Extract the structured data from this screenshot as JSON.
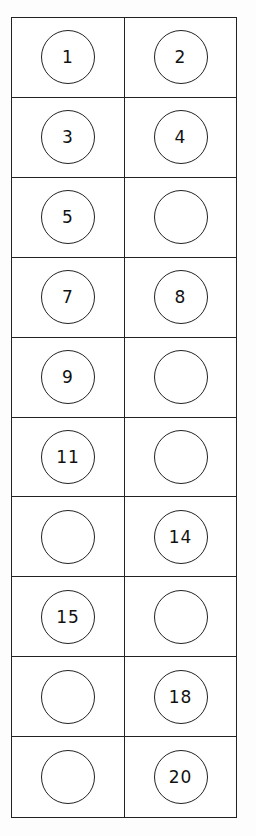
{
  "worksheet": {
    "title": "Number chart 1-20 (fill in missing numbers)",
    "columns": 2,
    "rows": 10,
    "cells": [
      {
        "number": "1",
        "blank": false
      },
      {
        "number": "2",
        "blank": false
      },
      {
        "number": "3",
        "blank": false
      },
      {
        "number": "4",
        "blank": false
      },
      {
        "number": "5",
        "blank": false
      },
      {
        "number": "",
        "blank": true
      },
      {
        "number": "7",
        "blank": false
      },
      {
        "number": "8",
        "blank": false
      },
      {
        "number": "9",
        "blank": false
      },
      {
        "number": "",
        "blank": true
      },
      {
        "number": "11",
        "blank": false
      },
      {
        "number": "",
        "blank": true
      },
      {
        "number": "",
        "blank": true
      },
      {
        "number": "14",
        "blank": false
      },
      {
        "number": "15",
        "blank": false
      },
      {
        "number": "",
        "blank": true
      },
      {
        "number": "",
        "blank": true
      },
      {
        "number": "18",
        "blank": false
      },
      {
        "number": "",
        "blank": true
      },
      {
        "number": "20",
        "blank": false
      }
    ],
    "line_color": "#222222",
    "background_color": "#ffffff"
  }
}
